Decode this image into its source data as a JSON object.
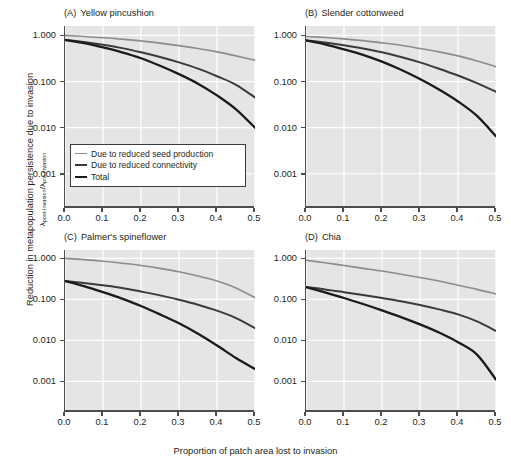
{
  "figure": {
    "ylabel_main": "Reduction in metapopulation persistence due to invasion",
    "ylabel_sub_prefix": "λ",
    "ylabel_sub_num": "post-invasion",
    "ylabel_sub_mid": "/",
    "ylabel_sub_prefix2": "λ",
    "ylabel_sub_den": "pre-invasion",
    "xlabel": "Proportion of patch area lost to invasion"
  },
  "legend": {
    "position": "inside panel A, lower left",
    "entries": [
      {
        "label": "Due to reduced seed production",
        "color": "#8c8c8c",
        "width": 1.6
      },
      {
        "label": "Due to reduced connectivity",
        "color": "#3a3a3a",
        "width": 2.0
      },
      {
        "label": "Total",
        "color": "#1a1a1a",
        "width": 2.4
      }
    ]
  },
  "axes": {
    "y_ticks": [
      "1.000",
      "0.100",
      "0.010",
      "0.001"
    ],
    "y_tick_values": [
      1.0,
      0.1,
      0.01,
      0.001
    ],
    "y_log": true,
    "ylim": [
      0.0002,
      1.6
    ],
    "x_ticks": [
      "0.0",
      "0.1",
      "0.2",
      "0.3",
      "0.4",
      "0.5"
    ],
    "x_tick_values": [
      0.0,
      0.1,
      0.2,
      0.3,
      0.4,
      0.5
    ],
    "xlim": [
      0.0,
      0.5
    ],
    "grid": "white gridlines on light gray panel"
  },
  "chart_data": [
    {
      "type": "line",
      "panel": "A",
      "letter": "(A)",
      "title": "Yellow pincushion",
      "xlabel": "Proportion of patch area lost to invasion",
      "ylabel": "λ post-invasion / λ pre-invasion",
      "yscale": "log",
      "ylim": [
        0.0002,
        1.6
      ],
      "xlim": [
        0.0,
        0.5
      ],
      "x": [
        0.0,
        0.05,
        0.1,
        0.15,
        0.2,
        0.25,
        0.3,
        0.35,
        0.4,
        0.45,
        0.5
      ],
      "series": [
        {
          "name": "Due to reduced seed production",
          "color": "#8c8c8c",
          "values": [
            1.0,
            0.95,
            0.89,
            0.83,
            0.76,
            0.68,
            0.6,
            0.52,
            0.44,
            0.36,
            0.29
          ]
        },
        {
          "name": "Due to reduced connectivity",
          "color": "#3a3a3a",
          "values": [
            0.8,
            0.72,
            0.63,
            0.53,
            0.43,
            0.34,
            0.26,
            0.19,
            0.13,
            0.085,
            0.045
          ]
        },
        {
          "name": "Total",
          "color": "#1a1a1a",
          "values": [
            0.8,
            0.68,
            0.55,
            0.43,
            0.32,
            0.22,
            0.145,
            0.09,
            0.05,
            0.025,
            0.01
          ]
        }
      ]
    },
    {
      "type": "line",
      "panel": "B",
      "letter": "(B)",
      "title": "Slender cottonweed",
      "xlabel": "Proportion of patch area lost to invasion",
      "ylabel": "λ post-invasion / λ pre-invasion",
      "yscale": "log",
      "ylim": [
        0.0002,
        1.6
      ],
      "xlim": [
        0.0,
        0.5
      ],
      "x": [
        0.0,
        0.05,
        0.1,
        0.15,
        0.2,
        0.25,
        0.3,
        0.35,
        0.4,
        0.45,
        0.5
      ],
      "series": [
        {
          "name": "Due to reduced seed production",
          "color": "#8c8c8c",
          "values": [
            0.95,
            0.9,
            0.84,
            0.77,
            0.69,
            0.61,
            0.52,
            0.44,
            0.36,
            0.28,
            0.21
          ]
        },
        {
          "name": "Due to reduced connectivity",
          "color": "#3a3a3a",
          "values": [
            0.78,
            0.7,
            0.61,
            0.52,
            0.43,
            0.34,
            0.26,
            0.19,
            0.135,
            0.092,
            0.06
          ]
        },
        {
          "name": "Total",
          "color": "#1a1a1a",
          "values": [
            0.78,
            0.64,
            0.5,
            0.38,
            0.27,
            0.18,
            0.113,
            0.067,
            0.037,
            0.018,
            0.0065
          ]
        }
      ]
    },
    {
      "type": "line",
      "panel": "C",
      "letter": "(C)",
      "title": "Palmer's spineflower",
      "xlabel": "Proportion of patch area lost to invasion",
      "ylabel": "λ post-invasion / λ pre-invasion",
      "yscale": "log",
      "ylim": [
        0.0002,
        1.6
      ],
      "xlim": [
        0.0,
        0.5
      ],
      "x": [
        0.0,
        0.05,
        0.1,
        0.15,
        0.2,
        0.25,
        0.3,
        0.35,
        0.4,
        0.45,
        0.5
      ],
      "series": [
        {
          "name": "Due to reduced seed production",
          "color": "#8c8c8c",
          "values": [
            1.0,
            0.93,
            0.85,
            0.76,
            0.67,
            0.57,
            0.47,
            0.37,
            0.28,
            0.19,
            0.11
          ]
        },
        {
          "name": "Due to reduced connectivity",
          "color": "#3a3a3a",
          "values": [
            0.28,
            0.25,
            0.22,
            0.19,
            0.155,
            0.125,
            0.098,
            0.074,
            0.053,
            0.035,
            0.02
          ]
        },
        {
          "name": "Total",
          "color": "#1a1a1a",
          "values": [
            0.28,
            0.21,
            0.15,
            0.104,
            0.069,
            0.043,
            0.026,
            0.0145,
            0.0075,
            0.0037,
            0.002
          ]
        }
      ]
    },
    {
      "type": "line",
      "panel": "D",
      "letter": "(D)",
      "title": "Chia",
      "xlabel": "Proportion of patch area lost to invasion",
      "ylabel": "λ post-invasion / λ pre-invasion",
      "yscale": "log",
      "ylim": [
        0.0002,
        1.6
      ],
      "xlim": [
        0.0,
        0.5
      ],
      "x": [
        0.0,
        0.05,
        0.1,
        0.15,
        0.2,
        0.25,
        0.3,
        0.35,
        0.4,
        0.45,
        0.5
      ],
      "series": [
        {
          "name": "Due to reduced seed production",
          "color": "#8c8c8c",
          "values": [
            0.9,
            0.78,
            0.67,
            0.57,
            0.49,
            0.41,
            0.34,
            0.28,
            0.22,
            0.175,
            0.135
          ]
        },
        {
          "name": "Due to reduced connectivity",
          "color": "#3a3a3a",
          "values": [
            0.2,
            0.175,
            0.15,
            0.128,
            0.108,
            0.09,
            0.073,
            0.057,
            0.043,
            0.029,
            0.017
          ]
        },
        {
          "name": "Total",
          "color": "#1a1a1a",
          "values": [
            0.2,
            0.148,
            0.108,
            0.077,
            0.054,
            0.037,
            0.0245,
            0.0155,
            0.009,
            0.0045,
            0.0011
          ]
        }
      ]
    }
  ]
}
